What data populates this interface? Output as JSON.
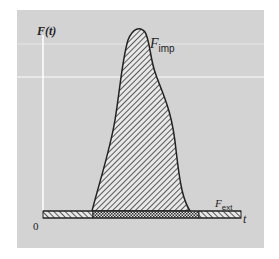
{
  "figure": {
    "y_axis_label": "F(t)",
    "x_axis_label": "t",
    "origin_label": "0",
    "impulsive_force": {
      "symbol": "F",
      "subscript": "imp"
    },
    "external_force": {
      "symbol": "F",
      "subscript": "ext"
    }
  },
  "colors": {
    "panel": "#d3d3d3",
    "axis": "#ffffff",
    "outline": "#222222",
    "hatch": "#333333"
  }
}
